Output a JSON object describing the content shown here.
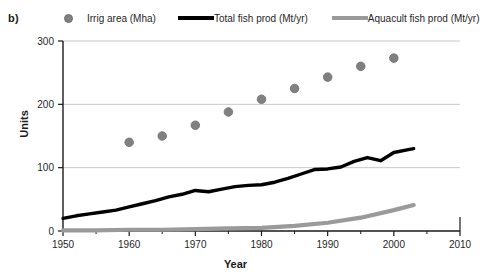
{
  "panel": {
    "label": "b)"
  },
  "legend": {
    "entries": [
      {
        "label": "Irrig area (Mha)",
        "marker": "circle-marker-icon",
        "color": "#808080"
      },
      {
        "label": "Total fish prod (Mt/yr)",
        "marker": "line-marker-icon",
        "color": "#000000"
      },
      {
        "label": "Aquacult fish prod (Mt/yr)",
        "marker": "line-marker-icon",
        "color": "#9a9a9a"
      }
    ]
  },
  "axes": {
    "y_title": "Units",
    "x_title": "Year",
    "y_ticks": [
      "0",
      "100",
      "200",
      "300"
    ],
    "x_ticks": [
      "1950",
      "1960",
      "1970",
      "1980",
      "1990",
      "2000",
      "2010"
    ]
  },
  "chart_data": {
    "type": "line",
    "title": "",
    "subtitle": "",
    "xlabel": "Year",
    "ylabel": "Units",
    "xlim": [
      1950,
      2010
    ],
    "ylim": [
      0,
      300
    ],
    "x_ticks": [
      1950,
      1960,
      1970,
      1980,
      1990,
      2000,
      2010
    ],
    "x_minor_tick_interval": 5,
    "y_ticks": [
      0,
      100,
      200,
      300
    ],
    "grid": "horizontal-gridlines-at-y-ticks",
    "legend_position": "top-horizontal",
    "panel_label": "b)",
    "series": [
      {
        "name": "Irrig area (Mha)",
        "type": "scatter",
        "color": "#808080",
        "marker": "filled-circle",
        "x": [
          1960,
          1965,
          1970,
          1975,
          1980,
          1985,
          1990,
          1995,
          2000
        ],
        "values": [
          140,
          150,
          167,
          188,
          208,
          225,
          243,
          260,
          273
        ]
      },
      {
        "name": "Total fish prod (Mt/yr)",
        "type": "line",
        "color": "#000000",
        "x": [
          1950,
          1952,
          1954,
          1956,
          1958,
          1960,
          1962,
          1964,
          1966,
          1968,
          1970,
          1972,
          1974,
          1976,
          1978,
          1980,
          1982,
          1984,
          1986,
          1988,
          1990,
          1992,
          1994,
          1996,
          1998,
          2000,
          2002,
          2003
        ],
        "values": [
          20,
          24,
          27,
          30,
          33,
          38,
          43,
          48,
          54,
          58,
          64,
          62,
          66,
          70,
          72,
          73,
          77,
          83,
          90,
          97,
          98,
          101,
          110,
          116,
          111,
          124,
          128,
          130
        ]
      },
      {
        "name": "Aquacult fish prod (Mt/yr)",
        "type": "line",
        "color": "#9a9a9a",
        "x": [
          1950,
          1955,
          1960,
          1965,
          1970,
          1975,
          1980,
          1985,
          1990,
          1995,
          2000,
          2003
        ],
        "values": [
          1,
          1,
          2,
          2,
          3,
          4,
          5,
          8,
          13,
          21,
          33,
          41
        ]
      }
    ]
  }
}
